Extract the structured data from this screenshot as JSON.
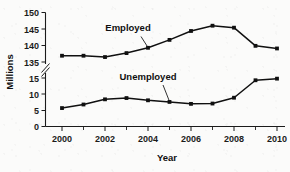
{
  "chart_data": {
    "type": "line",
    "title": "",
    "xlabel": "Year",
    "ylabel": "Millions",
    "x": [
      2000,
      2001,
      2002,
      2003,
      2004,
      2005,
      2006,
      2007,
      2008,
      2009,
      2010
    ],
    "xticklabels": [
      "2000",
      "2002",
      "2004",
      "2006",
      "2008",
      "2010"
    ],
    "xtickvalues": [
      2000,
      2002,
      2004,
      2006,
      2008,
      2010
    ],
    "xminortickvalues": [
      2001,
      2003,
      2005,
      2007,
      2009
    ],
    "xlim": [
      1999.5,
      2010.5
    ],
    "yticklabels": [
      "0",
      "5",
      "10",
      "15",
      "135",
      "140",
      "145",
      "150"
    ],
    "ytickvalues": [
      0,
      5,
      10,
      15,
      135,
      140,
      145,
      150
    ],
    "ylim_lower": [
      0,
      15
    ],
    "ylim_upper": [
      135,
      150
    ],
    "axis_break": true,
    "axis_break_label": "//",
    "grid": false,
    "legend": "inline-labels",
    "series": [
      {
        "name": "Employed",
        "label": "Employed",
        "values": [
          136.9,
          136.9,
          136.5,
          137.7,
          139.3,
          141.7,
          144.4,
          146.0,
          145.4,
          139.9,
          139.1
        ],
        "color": "#101010",
        "marker": "square"
      },
      {
        "name": "Unemployed",
        "label": "Unemployed",
        "values": [
          5.7,
          6.8,
          8.4,
          8.8,
          8.1,
          7.6,
          7.0,
          7.1,
          8.9,
          14.3,
          14.8
        ],
        "color": "#101010",
        "marker": "square"
      }
    ],
    "annotations": [
      {
        "text": "Employed",
        "points_to_year": 2004
      },
      {
        "text": "Unemployed",
        "points_to_year": 2005
      }
    ]
  }
}
